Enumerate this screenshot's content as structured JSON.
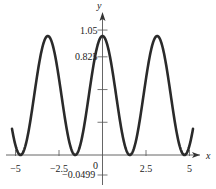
{
  "chart_data": {
    "type": "line",
    "title": "",
    "function": "y = cos^2(x)",
    "xlabel": "x",
    "ylabel": "y",
    "xlim": [
      -5.2,
      5.6
    ],
    "ylim": [
      -0.0499,
      1.05
    ],
    "x_ticks": [
      {
        "value": -5,
        "label": "-5"
      },
      {
        "value": -2.5,
        "label": "-2.5"
      },
      {
        "value": 0,
        "label": "0"
      },
      {
        "value": 2.5,
        "label": "2.5"
      },
      {
        "value": 5,
        "label": "5"
      }
    ],
    "y_ticks": [
      {
        "value": 1.05,
        "label": "1.05"
      },
      {
        "value": 0.825,
        "label": "0.825"
      },
      {
        "value": 0.55,
        "label": ""
      },
      {
        "value": 0.275,
        "label": ""
      }
    ],
    "y_min_label": "-0.0499",
    "grid": false,
    "series": [
      {
        "name": "cos^2(x)",
        "color": "#2a2a2a",
        "x_range": [
          -5.2,
          5.2
        ],
        "points": [
          [
            -5.2,
            0.22
          ],
          [
            -4.712,
            0.0
          ],
          [
            -3.927,
            0.5
          ],
          [
            -3.1416,
            1.0
          ],
          [
            -2.356,
            0.5
          ],
          [
            -1.5708,
            0.0
          ],
          [
            -0.785,
            0.5
          ],
          [
            0,
            1.0
          ],
          [
            0.785,
            0.5
          ],
          [
            1.5708,
            0.0
          ],
          [
            2.356,
            0.5
          ],
          [
            3.1416,
            1.0
          ],
          [
            3.927,
            0.5
          ],
          [
            4.712,
            0.0
          ],
          [
            5.2,
            0.22
          ]
        ]
      }
    ]
  }
}
